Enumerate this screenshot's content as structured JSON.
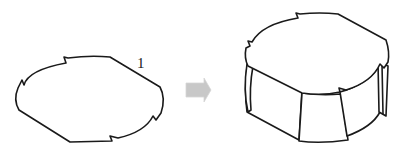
{
  "diagram": {
    "profile": {
      "label": "1",
      "stroke_color": "#1a1a1a"
    },
    "arrow": {
      "direction": "right",
      "color": "#c8c8c8"
    },
    "solid": {
      "stroke_color": "#1a1a1a",
      "fill_color": "#ffffff"
    }
  }
}
